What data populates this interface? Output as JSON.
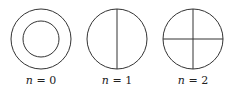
{
  "figure": {
    "stroke_color": "#333333",
    "panels": [
      {
        "id": "n0",
        "label_var": "n",
        "label_eq": " = ",
        "label_val": "0",
        "description": "two concentric circles (annulus), no nodal lines"
      },
      {
        "id": "n1",
        "label_var": "n",
        "label_eq": " = ",
        "label_val": "1",
        "description": "circle with one vertical diameter"
      },
      {
        "id": "n2",
        "label_var": "n",
        "label_eq": " = ",
        "label_val": "2",
        "description": "circle with vertical and horizontal diameters"
      }
    ]
  }
}
